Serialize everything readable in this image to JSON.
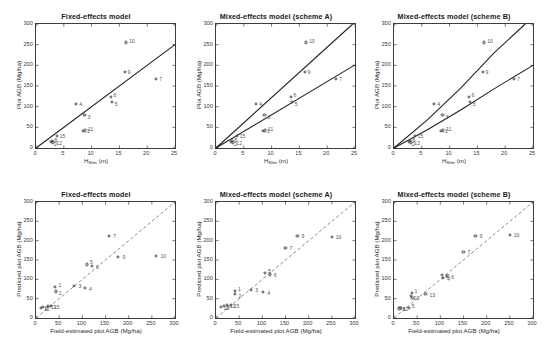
{
  "figure": {
    "caption_absent": true,
    "panels_rows": 2,
    "panels_cols": 3
  },
  "axis_labels": {
    "top_x_prefix": "H",
    "top_x_sub": "80m",
    "top_x_suffix": " (m)",
    "top_y": "Plot AGB (Mg/ha)",
    "bottom_x": "Field-estimated plot AGB (Mg/ha)",
    "bottom_y": "Predicted plot AGB (Mg/ha)"
  },
  "titles": {
    "fixed": "Fixed-effects model",
    "mixed_a": "Mixed-effects model (scheme A)",
    "mixed_b": "Mixed-effects model (scheme B)"
  },
  "ticks": {
    "top_x": [
      "0",
      "5",
      "10",
      "15",
      "20",
      "25"
    ],
    "top_y": [
      "0",
      "50",
      "100",
      "150",
      "200",
      "250",
      "300"
    ],
    "bottom_x": [
      "0",
      "50",
      "100",
      "150",
      "200",
      "250",
      "300"
    ],
    "bottom_y": [
      "0",
      "50",
      "100",
      "150",
      "200",
      "250",
      "300"
    ]
  },
  "colors": {
    "line": "#1f1f1f",
    "marker_edge": "#4a4a4a",
    "axis": "#3d3d3d",
    "text": "#2b2b2b",
    "identity_line": "#6b6b6b"
  },
  "chart_data": [
    {
      "id": "top-left",
      "type": "scatter",
      "title": "Fixed-effects model",
      "xlabel": "H80m (m)",
      "ylabel": "Plot AGB (Mg/ha)",
      "xlim": [
        0,
        25
      ],
      "ylim": [
        0,
        300
      ],
      "grid": false,
      "legend": "none",
      "points": [
        {
          "label": "1",
          "x": 8.6,
          "y": 38
        },
        {
          "label": "2",
          "x": 2.9,
          "y": 12
        },
        {
          "label": "3",
          "x": 8.9,
          "y": 78
        },
        {
          "label": "4",
          "x": 7.4,
          "y": 104
        },
        {
          "label": "5",
          "x": 13.8,
          "y": 108
        },
        {
          "label": "6",
          "x": 13.6,
          "y": 120
        },
        {
          "label": "7",
          "x": 21.8,
          "y": 165
        },
        {
          "label": "8",
          "x": 3.1,
          "y": 14
        },
        {
          "label": "9",
          "x": 16.1,
          "y": 182
        },
        {
          "label": "10",
          "x": 16.4,
          "y": 253
        },
        {
          "label": "11",
          "x": 9.0,
          "y": 40
        },
        {
          "label": "12",
          "x": 3.3,
          "y": 11
        },
        {
          "label": "15",
          "x": 3.9,
          "y": 26
        }
      ],
      "lines": [
        {
          "name": "fixed-effects fit",
          "style": "solid",
          "x": [
            0,
            25
          ],
          "y": [
            0,
            250
          ]
        }
      ]
    },
    {
      "id": "top-middle",
      "type": "scatter",
      "title": "Mixed-effects model (scheme A)",
      "xlabel": "H80m (m)",
      "ylabel": "Plot AGB (Mg/ha)",
      "xlim": [
        0,
        25
      ],
      "ylim": [
        0,
        300
      ],
      "grid": false,
      "legend": "none",
      "points": [
        {
          "label": "1",
          "x": 8.6,
          "y": 38
        },
        {
          "label": "2",
          "x": 2.9,
          "y": 12
        },
        {
          "label": "3",
          "x": 8.9,
          "y": 78
        },
        {
          "label": "4",
          "x": 7.4,
          "y": 104
        },
        {
          "label": "5",
          "x": 13.8,
          "y": 108
        },
        {
          "label": "6",
          "x": 13.6,
          "y": 120
        },
        {
          "label": "7",
          "x": 21.8,
          "y": 165
        },
        {
          "label": "8",
          "x": 3.1,
          "y": 14
        },
        {
          "label": "9",
          "x": 16.1,
          "y": 182
        },
        {
          "label": "10",
          "x": 16.4,
          "y": 253
        },
        {
          "label": "11",
          "x": 9.0,
          "y": 40
        },
        {
          "label": "12",
          "x": 3.3,
          "y": 11
        },
        {
          "label": "15",
          "x": 3.9,
          "y": 26
        }
      ],
      "lines": [
        {
          "name": "group-1 fit",
          "style": "solid",
          "x": [
            0,
            24.6
          ],
          "y": [
            0,
            300
          ]
        },
        {
          "name": "group-2 fit",
          "style": "solid",
          "x": [
            0,
            25
          ],
          "y": [
            0,
            201
          ]
        }
      ]
    },
    {
      "id": "top-right",
      "type": "scatter",
      "title": "Mixed-effects model (scheme B)",
      "xlabel": "H80m (m)",
      "ylabel": "Plot AGB (Mg/ha)",
      "xlim": [
        0,
        25
      ],
      "ylim": [
        0,
        300
      ],
      "grid": false,
      "legend": "none",
      "points": [
        {
          "label": "1",
          "x": 8.6,
          "y": 38
        },
        {
          "label": "2",
          "x": 2.9,
          "y": 12
        },
        {
          "label": "3",
          "x": 8.9,
          "y": 78
        },
        {
          "label": "4",
          "x": 7.4,
          "y": 104
        },
        {
          "label": "5",
          "x": 13.8,
          "y": 108
        },
        {
          "label": "6",
          "x": 13.6,
          "y": 120
        },
        {
          "label": "7",
          "x": 21.8,
          "y": 165
        },
        {
          "label": "8",
          "x": 3.1,
          "y": 14
        },
        {
          "label": "9",
          "x": 16.1,
          "y": 182
        },
        {
          "label": "10",
          "x": 16.4,
          "y": 253
        },
        {
          "label": "11",
          "x": 9.0,
          "y": 40
        },
        {
          "label": "12",
          "x": 3.3,
          "y": 11
        },
        {
          "label": "15",
          "x": 3.9,
          "y": 26
        }
      ],
      "lines": [
        {
          "name": "group-1 fit",
          "style": "solid-curved",
          "x": [
            0,
            6,
            12,
            18,
            23.6
          ],
          "y": [
            0,
            68,
            145,
            230,
            300
          ]
        },
        {
          "name": "group-2 fit",
          "style": "solid-curved",
          "x": [
            0,
            6,
            12,
            18,
            25
          ],
          "y": [
            0,
            44,
            92,
            143,
            200
          ]
        }
      ]
    },
    {
      "id": "bottom-left",
      "type": "scatter",
      "title": "Fixed-effects model",
      "xlabel": "Field-estimated plot AGB (Mg/ha)",
      "ylabel": "Predicted plot AGB (Mg/ha)",
      "xlim": [
        0,
        300
      ],
      "ylim": [
        0,
        300
      ],
      "grid": false,
      "legend": "none",
      "identity_line": {
        "style": "dashed",
        "x": [
          0,
          300
        ],
        "y": [
          0,
          300
        ]
      },
      "points": [
        {
          "label": "1",
          "x": 44,
          "y": 77
        },
        {
          "label": "2",
          "x": 45,
          "y": 66
        },
        {
          "label": "3",
          "x": 85,
          "y": 80
        },
        {
          "label": "4",
          "x": 108,
          "y": 76
        },
        {
          "label": "5",
          "x": 112,
          "y": 136
        },
        {
          "label": "6",
          "x": 123,
          "y": 131
        },
        {
          "label": "7",
          "x": 160,
          "y": 209
        },
        {
          "label": "8",
          "x": 18,
          "y": 25
        },
        {
          "label": "9",
          "x": 180,
          "y": 155
        },
        {
          "label": "10",
          "x": 262,
          "y": 157
        },
        {
          "label": "11",
          "x": 28,
          "y": 28
        },
        {
          "label": "12",
          "x": 13,
          "y": 24
        },
        {
          "label": "15",
          "x": 34,
          "y": 29
        }
      ]
    },
    {
      "id": "bottom-middle",
      "type": "scatter",
      "title": "Mixed-effects model (scheme A)",
      "xlabel": "Field-estimated plot AGB (Mg/ha)",
      "ylabel": "Predicted plot AGB (Mg/ha)",
      "xlim": [
        0,
        300
      ],
      "ylim": [
        0,
        300
      ],
      "grid": false,
      "legend": "none",
      "identity_line": {
        "style": "dashed",
        "x": [
          0,
          300
        ],
        "y": [
          0,
          300
        ]
      },
      "points": [
        {
          "label": "1",
          "x": 43,
          "y": 68
        },
        {
          "label": "2",
          "x": 44,
          "y": 60
        },
        {
          "label": "3",
          "x": 78,
          "y": 70
        },
        {
          "label": "4",
          "x": 104,
          "y": 64
        },
        {
          "label": "5",
          "x": 108,
          "y": 114
        },
        {
          "label": "6",
          "x": 118,
          "y": 110
        },
        {
          "label": "7",
          "x": 152,
          "y": 178
        },
        {
          "label": "8",
          "x": 20,
          "y": 28
        },
        {
          "label": "9",
          "x": 178,
          "y": 209
        },
        {
          "label": "10",
          "x": 252,
          "y": 208
        },
        {
          "label": "11",
          "x": 26,
          "y": 30
        },
        {
          "label": "12",
          "x": 12,
          "y": 26
        },
        {
          "label": "15",
          "x": 34,
          "y": 32
        }
      ]
    },
    {
      "id": "bottom-right",
      "type": "scatter",
      "title": "Mixed-effects model (scheme B)",
      "xlabel": "Field-estimated plot AGB (Mg/ha)",
      "ylabel": "Predicted plot AGB (Mg/ha)",
      "xlim": [
        0,
        300
      ],
      "ylim": [
        0,
        300
      ],
      "grid": false,
      "legend": "none",
      "identity_line": {
        "style": "dashed",
        "x": [
          0,
          300
        ],
        "y": [
          0,
          300
        ]
      },
      "points": [
        {
          "label": "1",
          "x": 40,
          "y": 62
        },
        {
          "label": "2",
          "x": 38,
          "y": 54
        },
        {
          "label": "3",
          "x": 42,
          "y": 50
        },
        {
          "label": "4",
          "x": 108,
          "y": 100
        },
        {
          "label": "5",
          "x": 34,
          "y": 24
        },
        {
          "label": "6",
          "x": 117,
          "y": 106
        },
        {
          "label": "7",
          "x": 152,
          "y": 168
        },
        {
          "label": "8",
          "x": 16,
          "y": 23
        },
        {
          "label": "9",
          "x": 178,
          "y": 210
        },
        {
          "label": "10",
          "x": 252,
          "y": 212
        },
        {
          "label": "11",
          "x": 106,
          "y": 108
        },
        {
          "label": "12",
          "x": 14,
          "y": 22
        },
        {
          "label": "13",
          "x": 70,
          "y": 60
        }
      ]
    }
  ]
}
